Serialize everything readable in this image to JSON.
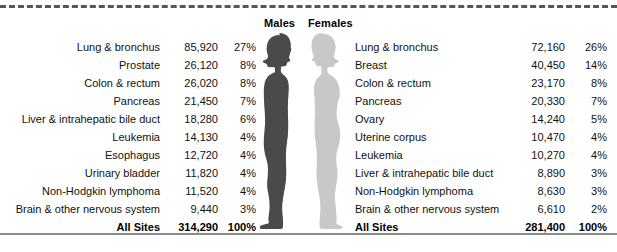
{
  "chart_data": {
    "type": "table",
    "title": "",
    "columns": [
      "Site",
      "Estimated Deaths",
      "Percent"
    ],
    "panels": [
      {
        "name": "Males",
        "total_label": "All Sites",
        "total_count": "314,290",
        "total_pct": "100%",
        "rows": [
          {
            "site": "Lung & bronchus",
            "count": "85,920",
            "pct": "27%"
          },
          {
            "site": "Prostate",
            "count": "26,120",
            "pct": "8%"
          },
          {
            "site": "Colon & rectum",
            "count": "26,020",
            "pct": "8%"
          },
          {
            "site": "Pancreas",
            "count": "21,450",
            "pct": "7%"
          },
          {
            "site": "Liver & intrahepatic bile duct",
            "count": "18,280",
            "pct": "6%"
          },
          {
            "site": "Leukemia",
            "count": "14,130",
            "pct": "4%"
          },
          {
            "site": "Esophagus",
            "count": "12,720",
            "pct": "4%"
          },
          {
            "site": "Urinary bladder",
            "count": "11,820",
            "pct": "4%"
          },
          {
            "site": "Non-Hodgkin lymphoma",
            "count": "11,520",
            "pct": "4%"
          },
          {
            "site": "Brain & other nervous system",
            "count": "9,440",
            "pct": "3%"
          }
        ]
      },
      {
        "name": "Females",
        "total_label": "All Sites",
        "total_count": "281,400",
        "total_pct": "100%",
        "rows": [
          {
            "site": "Lung & bronchus",
            "count": "72,160",
            "pct": "26%"
          },
          {
            "site": "Breast",
            "count": "40,450",
            "pct": "14%"
          },
          {
            "site": "Colon & rectum",
            "count": "23,170",
            "pct": "8%"
          },
          {
            "site": "Pancreas",
            "count": "20,330",
            "pct": "7%"
          },
          {
            "site": "Ovary",
            "count": "14,240",
            "pct": "5%"
          },
          {
            "site": "Uterine corpus",
            "count": "10,470",
            "pct": "4%"
          },
          {
            "site": "Leukemia",
            "count": "10,270",
            "pct": "4%"
          },
          {
            "site": "Liver & intrahepatic bile duct",
            "count": "8,890",
            "pct": "3%"
          },
          {
            "site": "Non-Hodgkin lymphoma",
            "count": "8,630",
            "pct": "3%"
          },
          {
            "site": "Brain & other nervous system",
            "count": "6,610",
            "pct": "2%"
          }
        ]
      }
    ]
  },
  "headers": {
    "males": "Males",
    "females": "Females"
  },
  "colors": {
    "male_silhouette": "#4a4a4a",
    "female_silhouette": "#c8c8c8",
    "top_rule": "#575757",
    "bottom_rule": "#8c8c8c",
    "text": "#111111"
  },
  "icons": {
    "male": "male-silhouette-icon",
    "female": "female-silhouette-icon"
  }
}
